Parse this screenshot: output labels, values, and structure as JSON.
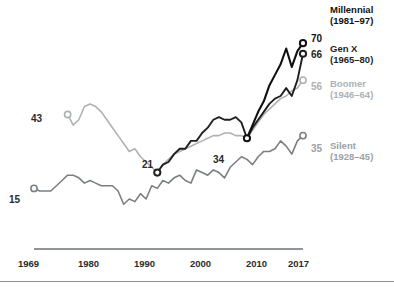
{
  "chart_data": {
    "type": "line",
    "title": "",
    "xlabel": "",
    "ylabel": "",
    "xlim": [
      1969,
      2017
    ],
    "ylim": [
      0,
      75
    ],
    "grid": false,
    "legend_position": "right",
    "tick_labels_x": [
      "1969",
      "1980",
      "1990",
      "2000",
      "2010",
      "2017"
    ],
    "tick_values_x": [
      1969,
      1980,
      1990,
      2000,
      2010,
      2017
    ],
    "series": [
      {
        "name": "Millennial",
        "years_label": "(1981–97)",
        "color": "#111111",
        "start_label": "34",
        "end_label": "70",
        "start_year": 2007,
        "end_year": 2017,
        "x": [
          2007,
          2008,
          2009,
          2010,
          2011,
          2012,
          2013,
          2014,
          2015,
          2016,
          2017
        ],
        "values": [
          34,
          39,
          44,
          48,
          54,
          58,
          62,
          68,
          61,
          67,
          70
        ]
      },
      {
        "name": "Gen X",
        "years_label": "(1965–80)",
        "color": "#1f1f1f",
        "start_label": "21",
        "end_label": "66",
        "start_year": 1991,
        "end_year": 2017,
        "x": [
          1991,
          1992,
          1993,
          1994,
          1995,
          1996,
          1997,
          1998,
          1999,
          2000,
          2001,
          2002,
          2003,
          2004,
          2005,
          2006,
          2007,
          2008,
          2009,
          2010,
          2011,
          2012,
          2013,
          2014,
          2015,
          2016,
          2017
        ],
        "values": [
          21,
          24,
          25,
          28,
          30,
          30,
          33,
          33,
          36,
          38,
          41,
          42,
          41,
          41,
          42,
          40,
          34,
          38,
          41,
          44,
          47,
          49,
          50,
          53,
          50,
          56,
          66
        ]
      },
      {
        "name": "Boomer",
        "years_label": "(1946–64)",
        "color": "#aeb1b5",
        "start_label": "43",
        "end_label": "56",
        "start_year": 1975,
        "end_year": 2017,
        "x": [
          1975,
          1976,
          1977,
          1978,
          1979,
          1980,
          1981,
          1982,
          1983,
          1984,
          1985,
          1986,
          1987,
          1988,
          1989,
          1990,
          1991,
          1992,
          1993,
          1994,
          1995,
          1996,
          1997,
          1998,
          1999,
          2000,
          2001,
          2002,
          2003,
          2004,
          2005,
          2006,
          2007,
          2008,
          2009,
          2010,
          2011,
          2012,
          2013,
          2014,
          2015,
          2016,
          2017
        ],
        "values": [
          43,
          39,
          41,
          46,
          47,
          46,
          44,
          41,
          38,
          35,
          32,
          29,
          30,
          27,
          25,
          23,
          21,
          24,
          26,
          28,
          29,
          30,
          31,
          32,
          33,
          34,
          35,
          35,
          36,
          36,
          35,
          35,
          34,
          37,
          40,
          43,
          45,
          47,
          49,
          50,
          52,
          53,
          56
        ]
      },
      {
        "name": "Silent",
        "years_label": "(1928–45)",
        "color": "#7b7f84",
        "start_label": "15",
        "end_label": "35",
        "start_year": 1969,
        "end_year": 2017,
        "x": [
          1969,
          1970,
          1971,
          1972,
          1973,
          1974,
          1975,
          1976,
          1977,
          1978,
          1979,
          1980,
          1981,
          1982,
          1983,
          1984,
          1985,
          1986,
          1987,
          1988,
          1989,
          1990,
          1991,
          1992,
          1993,
          1994,
          1995,
          1996,
          1997,
          1998,
          1999,
          2000,
          2001,
          2002,
          2003,
          2004,
          2005,
          2006,
          2007,
          2008,
          2009,
          2010,
          2011,
          2012,
          2013,
          2014,
          2015,
          2016,
          2017
        ],
        "values": [
          15,
          14,
          14,
          14,
          16,
          18,
          20,
          20,
          19,
          17,
          18,
          17,
          16,
          16,
          16,
          14,
          9,
          11,
          10,
          13,
          11,
          16,
          15,
          18,
          17,
          19,
          20,
          18,
          17,
          22,
          21,
          20,
          22,
          21,
          19,
          23,
          25,
          27,
          26,
          24,
          27,
          29,
          29,
          30,
          33,
          31,
          28,
          33,
          35
        ]
      }
    ]
  },
  "axis": {
    "line_color": "#6e7276"
  },
  "cut_title": "—————————"
}
